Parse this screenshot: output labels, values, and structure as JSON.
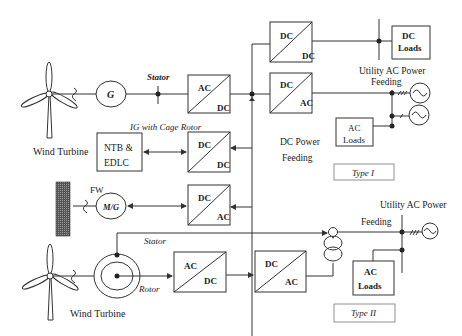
{
  "diagram": {
    "type_labels": {
      "type1": "Type I",
      "type2": "Type II"
    },
    "type1": {
      "wind_turbine": "Wind Turbine",
      "generator": "G",
      "stator": "Stator",
      "ig_note": "IG with Cage Rotor",
      "ac_dc": {
        "top": "AC",
        "bottom": "DC"
      },
      "dc_dc_top": {
        "top": "DC",
        "bottom": "DC"
      },
      "dc_ac_grid": {
        "top": "DC",
        "bottom": "AC"
      },
      "dc_dc_storage": {
        "top": "DC",
        "bottom": "DC"
      },
      "dc_ac_fw": {
        "top": "DC",
        "bottom": "AC"
      },
      "storage": {
        "line1": "NTB &",
        "line2": "EDLC"
      },
      "fw": "FW",
      "motor_generator": "M/G",
      "dc_loads": {
        "line1": "DC",
        "line2": "Loads"
      },
      "utility": {
        "line1": "Utility AC Power",
        "line2": "Feeding"
      },
      "ac_loads": {
        "line1": "AC",
        "line2": "Loads"
      },
      "dc_feeding": {
        "line1": "DC Power",
        "line2": "Feeding"
      }
    },
    "type2": {
      "wind_turbine": "Wind Turbine",
      "stator": "Stator",
      "rotor": "Rotor",
      "ac_dc": {
        "top": "AC",
        "bottom": "DC"
      },
      "dc_ac": {
        "top": "DC",
        "bottom": "AC"
      },
      "utility": {
        "line1": "Utility AC Power",
        "line2": "Feeding"
      },
      "ac_loads": {
        "line1": "AC",
        "line2": "Loads"
      }
    }
  }
}
